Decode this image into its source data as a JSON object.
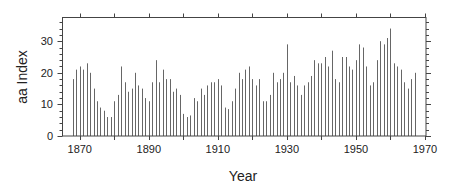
{
  "chart_data": {
    "type": "bar",
    "title": "",
    "xlabel": "Year",
    "ylabel": "aa Index",
    "xlim": [
      1865,
      1970.3
    ],
    "ylim": [
      0,
      37.5
    ],
    "x_ticks": [
      1870,
      1890,
      1910,
      1930,
      1950,
      1970
    ],
    "x_tick_labels": [
      "1870",
      "1890",
      "1910",
      "1930",
      "1950",
      "1970"
    ],
    "x_minor_tick_step": 10,
    "y_ticks": [
      0,
      10,
      20,
      30
    ],
    "y_tick_labels": [
      "0",
      "10",
      "20",
      "30"
    ],
    "y_minor_tick_step": 2,
    "grid": false,
    "legend": null,
    "bar_style": "thin vertical lines",
    "bar_color": "#666666",
    "axis_color": "#444444",
    "x": [
      1868,
      1869,
      1870,
      1871,
      1872,
      1873,
      1874,
      1875,
      1876,
      1877,
      1878,
      1879,
      1880,
      1881,
      1882,
      1883,
      1884,
      1885,
      1886,
      1887,
      1888,
      1889,
      1890,
      1891,
      1892,
      1893,
      1894,
      1895,
      1896,
      1897,
      1898,
      1899,
      1900,
      1901,
      1902,
      1903,
      1904,
      1905,
      1906,
      1907,
      1908,
      1909,
      1910,
      1911,
      1912,
      1913,
      1914,
      1915,
      1916,
      1917,
      1918,
      1919,
      1920,
      1921,
      1922,
      1923,
      1924,
      1925,
      1926,
      1927,
      1928,
      1929,
      1930,
      1931,
      1932,
      1933,
      1934,
      1935,
      1936,
      1937,
      1938,
      1939,
      1940,
      1941,
      1942,
      1943,
      1944,
      1945,
      1946,
      1947,
      1948,
      1949,
      1950,
      1951,
      1952,
      1953,
      1954,
      1955,
      1956,
      1957,
      1958,
      1959,
      1960,
      1961,
      1962,
      1963,
      1964,
      1965,
      1966,
      1967
    ],
    "values": [
      18,
      21,
      22,
      21,
      23,
      20,
      15,
      11,
      9,
      8,
      6,
      6,
      11,
      13,
      22,
      17,
      14,
      15,
      20,
      16,
      15,
      12,
      11,
      17,
      24,
      17,
      21,
      18,
      18,
      14,
      15,
      13,
      7,
      6,
      6.5,
      12,
      11,
      15,
      13,
      16,
      17,
      17,
      18,
      16,
      9,
      8.5,
      11,
      15,
      20,
      18,
      21,
      22,
      18,
      16,
      18,
      11,
      11,
      13,
      20,
      17,
      18,
      20,
      29,
      17,
      19,
      16,
      13,
      16,
      17,
      19,
      24,
      23,
      23,
      25,
      22,
      27,
      18,
      17,
      25,
      25,
      22,
      21,
      24,
      29,
      28,
      22,
      16,
      17,
      24,
      30,
      29,
      31,
      34,
      23,
      22,
      21,
      17,
      15,
      18,
      20
    ]
  }
}
